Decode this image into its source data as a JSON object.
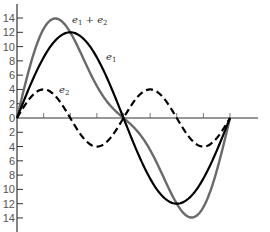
{
  "chart_data": {
    "type": "line",
    "title": "",
    "xlabel": "",
    "ylabel": "",
    "x_range_degrees": [
      0,
      360
    ],
    "ylim": [
      -15,
      15
    ],
    "y_ticks": [
      14,
      12,
      10,
      8,
      6,
      4,
      2,
      0,
      2,
      4,
      6,
      8,
      10,
      12,
      14
    ],
    "y_tick_values": [
      14,
      12,
      10,
      8,
      6,
      4,
      2,
      0,
      -2,
      -4,
      -6,
      -8,
      -10,
      -12,
      -14
    ],
    "x_ticks_count": 8,
    "grid": false,
    "legend": "inline labels",
    "series": [
      {
        "name": "e1",
        "label_main": "e",
        "label_sub": "1",
        "style": "solid",
        "color": "#000000",
        "amplitude": 12,
        "harmonic": 1,
        "x": [
          0,
          30,
          60,
          90,
          120,
          150,
          180,
          210,
          240,
          270,
          300,
          330,
          360
        ],
        "values": [
          0,
          6,
          10.4,
          12,
          10.4,
          6,
          0,
          -6,
          -10.4,
          -12,
          -10.4,
          -6,
          0
        ]
      },
      {
        "name": "e2",
        "label_main": "e",
        "label_sub": "2",
        "style": "dashed",
        "color": "#000000",
        "amplitude": 4,
        "harmonic": 2,
        "x": [
          0,
          30,
          60,
          90,
          120,
          150,
          180,
          210,
          240,
          270,
          300,
          330,
          360
        ],
        "values": [
          0,
          3.5,
          3.5,
          0,
          -3.5,
          -3.5,
          0,
          3.5,
          3.5,
          0,
          -3.5,
          -3.5,
          0
        ]
      },
      {
        "name": "e1 + e2",
        "label_main": "e",
        "label_sub": "1",
        "label_rest": " + e",
        "label_sub2": "2",
        "style": "solid",
        "color": "#6a6a6a",
        "x": [
          0,
          30,
          60,
          90,
          120,
          150,
          180,
          210,
          240,
          270,
          300,
          330,
          360
        ],
        "values": [
          0,
          9.5,
          13.9,
          12,
          6.9,
          2.5,
          0,
          -2.5,
          -6.9,
          -12,
          -13.9,
          -9.5,
          0
        ]
      }
    ]
  },
  "labels": {
    "sum": {
      "e": "e",
      "sub1": "1",
      "plus": " + ",
      "e2": "e",
      "sub2": "2"
    },
    "e1": {
      "e": "e",
      "sub": "1"
    },
    "e2": {
      "e": "e",
      "sub": "2"
    }
  },
  "colors": {
    "axis": "#333333",
    "e1": "#000000",
    "e2": "#000000",
    "sum": "#6a6a6a",
    "tick_text": "#555555"
  }
}
